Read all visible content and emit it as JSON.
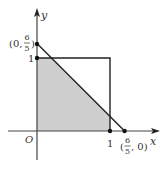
{
  "diagram": {
    "type": "coordinate-region",
    "axes": {
      "x_label": "x",
      "y_label": "y",
      "origin_label": "O"
    },
    "ticks": {
      "x_one": "1",
      "y_one": "1"
    },
    "points": {
      "y_intercept": {
        "label_prefix": "(0, ",
        "num": "6",
        "den": "5",
        "label_suffix": ")"
      },
      "x_intercept": {
        "label_prefix": "(",
        "num": "6",
        "den": "5",
        "label_suffix": ", 0)"
      }
    },
    "shapes": {
      "unit_square": "square with corners (0,0),(1,0),(1,1),(0,1)",
      "line": "x + y = 6/5",
      "shaded_region": "part of unit square below line x + y = 6/5"
    },
    "colors": {
      "shade": "#cfcfcf",
      "stroke": "#222222",
      "axis": "#444444"
    }
  }
}
